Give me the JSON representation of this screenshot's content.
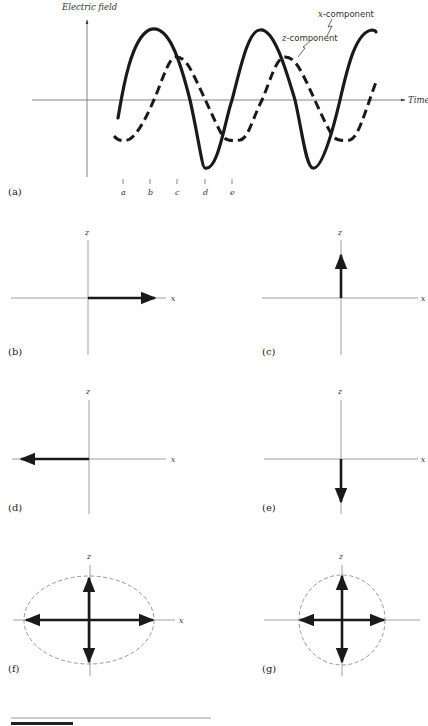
{
  "figure": {
    "panel_a": {
      "label": "(a)",
      "y_axis_label": "Electric field",
      "x_axis_label": "Time",
      "series": [
        {
          "name": "x-component",
          "label": "x-component",
          "style": "solid",
          "amplitude_rel": 1.0
        },
        {
          "name": "z-component",
          "label": "z-component",
          "style": "dashed",
          "amplitude_rel": 0.6,
          "phase_lag": "quarter period"
        }
      ],
      "time_markers": [
        "a",
        "b",
        "c",
        "d",
        "e"
      ]
    },
    "panels": [
      {
        "id": "b",
        "label": "(b)",
        "x_label": "x",
        "z_label": "z",
        "vector": "+x"
      },
      {
        "id": "c",
        "label": "(c)",
        "x_label": "x",
        "z_label": "z",
        "vector": "+z"
      },
      {
        "id": "d",
        "label": "(d)",
        "x_label": "x",
        "z_label": "z",
        "vector": "-x"
      },
      {
        "id": "e",
        "label": "(e)",
        "x_label": "x",
        "z_label": "z",
        "vector": "-z"
      },
      {
        "id": "f",
        "label": "(f)",
        "x_label": "x",
        "z_label": "z",
        "vector": "±x, ±z",
        "trace": "ellipse"
      },
      {
        "id": "g",
        "label": "(g)",
        "x_label": "",
        "z_label": "z",
        "vector": "±x, ±z",
        "trace": "circle"
      }
    ]
  },
  "colors": {
    "ink": "#1a1a1a",
    "axis": "#8a8a8a",
    "dashed_trace": "#9a9a9a"
  }
}
